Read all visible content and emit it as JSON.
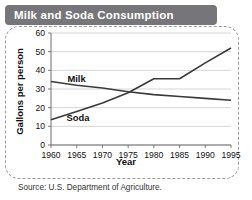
{
  "title": "Milk and Soda Consumption",
  "source": "Source: U.S. Department of Agriculture.",
  "labels": {
    "milk": "Milk",
    "soda": "Soda"
  },
  "colors": {
    "title_bar": "#76767a",
    "title_text": "#ffffff",
    "line": "#3a3a3a",
    "gridline": "#c9c9c9",
    "axis": "#6e6e6e",
    "frame_dashed": "#9a9a9a"
  },
  "chart_data": {
    "type": "line",
    "title": "Milk and Soda Consumption",
    "xlabel": "Year",
    "ylabel": "Gallons per person",
    "x": [
      1960,
      1965,
      1970,
      1975,
      1980,
      1985,
      1990,
      1995
    ],
    "xticklabels": [
      "1960",
      "1965",
      "1970",
      "1975",
      "1980",
      "1985",
      "1990",
      "1995"
    ],
    "xlim": [
      1960,
      1995
    ],
    "ylim": [
      0,
      60
    ],
    "yticks": [
      0,
      10,
      20,
      30,
      40,
      50,
      60
    ],
    "yticklabels": [
      "0",
      "10",
      "20",
      "30",
      "40",
      "50",
      "60"
    ],
    "grid": "horizontal",
    "legend": "inline-labels",
    "series": [
      {
        "name": "Milk",
        "values": [
          34,
          32,
          30.5,
          28.5,
          27,
          26,
          25,
          24
        ]
      },
      {
        "name": "Soda",
        "values": [
          13.5,
          18,
          22.5,
          28,
          35.5,
          35.5,
          44,
          52
        ]
      }
    ]
  }
}
